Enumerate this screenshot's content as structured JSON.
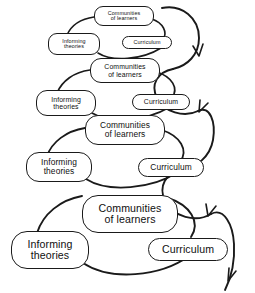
{
  "diagram": {
    "type": "spiral-cycle-diagram",
    "background_color": "#ffffff",
    "stroke_color": "#1a1a1a",
    "node_labels": {
      "communities_line1": "Communities",
      "communities_line2": "of learners",
      "informing_line1": "Informing",
      "informing_line2": "theories",
      "curriculum": "Curriculum"
    },
    "tiers": [
      {
        "index": 1,
        "scale": "smallest",
        "nodes": {
          "top": {
            "line1": "Communities",
            "line2": "of learners"
          },
          "left": {
            "line1": "Informing",
            "line2": "theories"
          },
          "right": {
            "line1": "Curriculum"
          }
        }
      },
      {
        "index": 2,
        "scale": "small",
        "nodes": {
          "top": {
            "line1": "Communities",
            "line2": "of learners"
          },
          "left": {
            "line1": "Informing",
            "line2": "theories"
          },
          "right": {
            "line1": "Curriculum"
          }
        }
      },
      {
        "index": 3,
        "scale": "medium",
        "nodes": {
          "top": {
            "line1": "Communities",
            "line2": "of learners"
          },
          "left": {
            "line1": "Informing",
            "line2": "theories"
          },
          "right": {
            "line1": "Curriculum"
          }
        }
      },
      {
        "index": 4,
        "scale": "large",
        "nodes": {
          "top": {
            "line1": "Communities",
            "line2": "of learners"
          },
          "left": {
            "line1": "Informing",
            "line2": "theories"
          },
          "right": {
            "line1": "Curriculum"
          }
        }
      }
    ],
    "spiral": {
      "name": "descending-spiral-arrow",
      "arrowhead_count": 4,
      "direction": "downward"
    }
  }
}
